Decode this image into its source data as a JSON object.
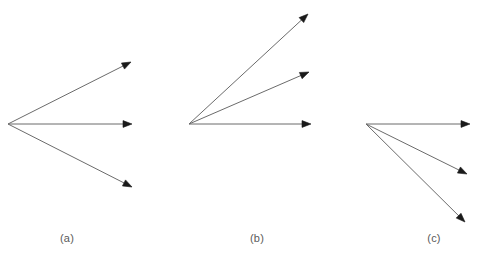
{
  "figure": {
    "background_color": "#ffffff",
    "stroke_color": "#6b6b6b",
    "arrowhead_color": "#1a1a1a",
    "caption_color": "#5a5a5a",
    "width": 484,
    "height": 260
  },
  "panels": [
    {
      "id": "a",
      "caption": "(a)",
      "caption_x": 67,
      "caption_y": 232,
      "origin": {
        "x": 8,
        "y": 124
      },
      "arrows": [
        {
          "name": "arrow-up",
          "tip_x": 131,
          "tip_y": 62
        },
        {
          "name": "arrow-middle",
          "tip_x": 132,
          "tip_y": 124
        },
        {
          "name": "arrow-down",
          "tip_x": 132,
          "tip_y": 187
        }
      ]
    },
    {
      "id": "b",
      "caption": "(b)",
      "caption_x": 257,
      "caption_y": 232,
      "origin": {
        "x": 189,
        "y": 124
      },
      "arrows": [
        {
          "name": "arrow-upper",
          "tip_x": 308,
          "tip_y": 14
        },
        {
          "name": "arrow-mid",
          "tip_x": 309,
          "tip_y": 72
        },
        {
          "name": "arrow-horizontal",
          "tip_x": 311,
          "tip_y": 124
        }
      ]
    },
    {
      "id": "c",
      "caption": "(c)",
      "caption_x": 434,
      "caption_y": 232,
      "origin": {
        "x": 366,
        "y": 124
      },
      "arrows": [
        {
          "name": "arrow-horizontal",
          "tip_x": 470,
          "tip_y": 124
        },
        {
          "name": "arrow-lower",
          "tip_x": 467,
          "tip_y": 174
        },
        {
          "name": "arrow-lowest",
          "tip_x": 465,
          "tip_y": 222
        }
      ]
    }
  ]
}
